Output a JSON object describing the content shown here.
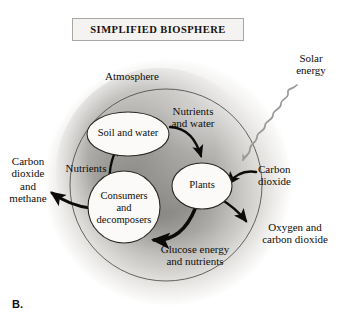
{
  "figure": {
    "panel_label": "B.",
    "title": "SIMPLIFIED BIOSPHERE",
    "background_color": "#ffffff"
  },
  "colors": {
    "text": "#100d0a",
    "arrow": "#0d0b09",
    "squiggle": "#8e8c88",
    "node_fill": "#fbfaf8",
    "node_stroke": "#2a2724",
    "inner_circle_stroke": "#3a3734",
    "sphere_light": "#f2f1ef",
    "sphere_mid": "#b9b7b3",
    "sphere_dark": "#74726e",
    "plate_fill": "#f4f3f1",
    "plate_border": "#a9a7a3"
  },
  "labels": {
    "atmosphere": "Atmosphere",
    "solar_energy": "Solar\nenergy",
    "nutrients_and_water": "Nutrients\nand water",
    "nutrients": "Nutrients",
    "carbon_dioxide_and_methane": "Carbon\ndioxide\nand\nmethane",
    "carbon_dioxide": "Carbon\ndioxide",
    "oxygen_and_carbon_dioxide": "Oxygen and\ncarbon dioxide",
    "glucose_energy_and_nutrients": "Glucose energy\nand nutrients"
  },
  "nodes": [
    {
      "id": "soil-and-water",
      "label": "Soil and water",
      "shape": "ellipse",
      "cx": 128,
      "cy": 134,
      "rx": 41,
      "ry": 22
    },
    {
      "id": "consumers-and-decomposers",
      "label": "Consumers\nand\ndecomposers",
      "shape": "circle",
      "cx": 124,
      "cy": 207,
      "rx": 36,
      "ry": 36
    },
    {
      "id": "plants",
      "label": "Plants",
      "shape": "ellipse",
      "cx": 202,
      "cy": 186,
      "rx": 30,
      "ry": 23
    }
  ],
  "flows": [
    {
      "id": "soil-to-plants",
      "label": "Nutrients and water",
      "from": "soil-and-water",
      "to": "plants"
    },
    {
      "id": "plants-to-consumers",
      "label": "Glucose energy and nutrients",
      "from": "plants",
      "to": "consumers-and-decomposers"
    },
    {
      "id": "consumers-to-soil",
      "label": "Nutrients",
      "from": "consumers-and-decomposers",
      "to": "soil-and-water"
    },
    {
      "id": "consumers-to-atmosphere",
      "label": "Carbon dioxide and methane",
      "from": "consumers-and-decomposers",
      "to": "outside"
    },
    {
      "id": "atmosphere-to-plants",
      "label": "Carbon dioxide",
      "from": "outside",
      "to": "plants"
    },
    {
      "id": "plants-to-atmosphere",
      "label": "Oxygen and carbon dioxide",
      "from": "plants",
      "to": "outside"
    },
    {
      "id": "sun-to-biosphere",
      "label": "Solar energy",
      "from": "outside",
      "to": "biosphere"
    }
  ],
  "regions": {
    "sphere": {
      "cx": 168,
      "cy": 182,
      "r": 124,
      "name": "biosphere-sphere"
    },
    "inner_circle": {
      "cx": 166,
      "cy": 185,
      "r": 96,
      "name": "atmosphere-inner-circle"
    }
  }
}
